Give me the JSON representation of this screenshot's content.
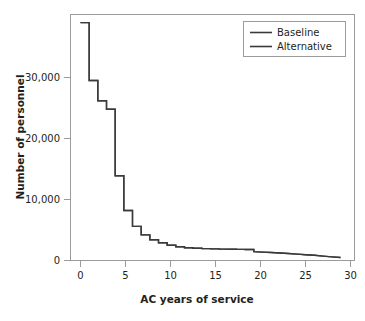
{
  "chart_data": {
    "type": "line",
    "title": "",
    "xlabel": "AC years of service",
    "ylabel": "Number of personnel",
    "xlim": [
      0,
      30
    ],
    "ylim": [
      0,
      39500
    ],
    "xticks": [
      0,
      5,
      10,
      15,
      20,
      25,
      30
    ],
    "xtick_labels": [
      "0",
      "5",
      "10",
      "15",
      "20",
      "25",
      "30"
    ],
    "yticks": [
      0,
      10000,
      20000,
      30000
    ],
    "ytick_labels": [
      "0",
      "10,000",
      "20,000",
      "30,000"
    ],
    "grid": false,
    "drawstyle": "steps-post",
    "legend_position": "top-right",
    "x": [
      0,
      1,
      2,
      3,
      4,
      5,
      6,
      7,
      8,
      9,
      10,
      11,
      12,
      13,
      14,
      15,
      16,
      17,
      18,
      19,
      20,
      21,
      22,
      23,
      24,
      25,
      26,
      27,
      28,
      29,
      30
    ],
    "series": [
      {
        "name": "Baseline",
        "color": "#3a3a3a",
        "values": [
          39000,
          29500,
          26200,
          24800,
          13900,
          8200,
          5600,
          4200,
          3400,
          2900,
          2500,
          2250,
          2100,
          2000,
          1950,
          1900,
          1870,
          1850,
          1820,
          1800,
          1450,
          1380,
          1300,
          1230,
          1150,
          1050,
          950,
          850,
          720,
          600,
          480
        ]
      },
      {
        "name": "Alternative",
        "color": "#3a3a3a",
        "values": [
          39000,
          29500,
          26200,
          24800,
          13900,
          8200,
          5600,
          4200,
          3400,
          2900,
          2500,
          2250,
          2100,
          2000,
          1950,
          1900,
          1870,
          1850,
          1820,
          1800,
          1450,
          1380,
          1300,
          1230,
          1150,
          1050,
          950,
          850,
          720,
          600,
          480
        ]
      }
    ]
  },
  "legend": {
    "items": [
      {
        "label": "Baseline",
        "color": "#3a3a3a"
      },
      {
        "label": "Alternative",
        "color": "#3a3a3a"
      }
    ]
  },
  "axes": {
    "x_title": "AC years of service",
    "y_title": "Number of personnel"
  },
  "colors": {
    "frame": "#9b9b9b",
    "text": "#231f20",
    "line": "#3a3a3a",
    "background": "#ffffff"
  }
}
